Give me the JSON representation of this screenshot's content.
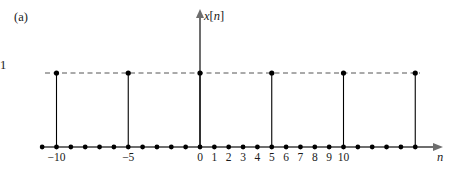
{
  "figure": {
    "panel_label": "(a)",
    "y_axis_label_italic": "x",
    "y_axis_label_bracket_open": "[",
    "y_axis_label_index": "n",
    "y_axis_label_bracket_close": "]",
    "y_axis_label_full": "x[n]",
    "x_axis_label": "n",
    "amplitude_label": "1",
    "colors": {
      "stem": "#000000",
      "marker": "#000000",
      "axis": "#6e6e6e",
      "dashed_guide": "#555555",
      "text": "#1a1a1a",
      "background": "#ffffff"
    }
  },
  "chart_data": {
    "type": "line",
    "title": "",
    "subtitle": "",
    "xlabel": "n",
    "ylabel": "x[n]",
    "plot_style": "discrete-time stem plot with dashed amplitude guide at 1",
    "grid": false,
    "legend": null,
    "xlim": [
      -12,
      16
    ],
    "ylim": [
      0,
      1.45
    ],
    "y_tick_labels": [
      "1"
    ],
    "y_tick_values": [
      1
    ],
    "x_tick_labels": [
      "-10",
      "-5",
      "0",
      "1",
      "2",
      "3",
      "4",
      "5",
      "6",
      "7",
      "8",
      "9",
      "10"
    ],
    "x_tick_values": [
      -10,
      -5,
      0,
      1,
      2,
      3,
      4,
      5,
      6,
      7,
      8,
      9,
      10
    ],
    "x": [
      -11,
      -10,
      -9,
      -8,
      -7,
      -6,
      -5,
      -4,
      -3,
      -2,
      -1,
      0,
      1,
      2,
      3,
      4,
      5,
      6,
      7,
      8,
      9,
      10,
      11,
      12,
      13,
      14,
      15
    ],
    "values": [
      0,
      1,
      0,
      0,
      0,
      0,
      1,
      0,
      0,
      0,
      0,
      1,
      0,
      0,
      0,
      0,
      1,
      0,
      0,
      0,
      0,
      1,
      0,
      0,
      0,
      0,
      1
    ],
    "nonzero_positions": [
      -10,
      -5,
      0,
      5,
      10,
      15
    ],
    "period": 5,
    "annotations": [
      {
        "text": "(a)",
        "x_px": 14,
        "y_px": 11
      },
      {
        "text": "1",
        "x_px": 191,
        "y_px": 59
      },
      {
        "text": "x[n]",
        "x_px": 204,
        "y_px": 10
      },
      {
        "text": "n",
        "x_px": 437,
        "y_px": 151
      }
    ]
  },
  "geometry": {
    "origin_x_px": 200,
    "baseline_y_px": 147,
    "unit_px": 14.35,
    "amplitude_y_px": 73,
    "y_axis_top_px": 11,
    "x_axis_left_px": 40,
    "x_axis_right_px": 441,
    "dash_left_px": 45,
    "dash_right_px": 420
  }
}
